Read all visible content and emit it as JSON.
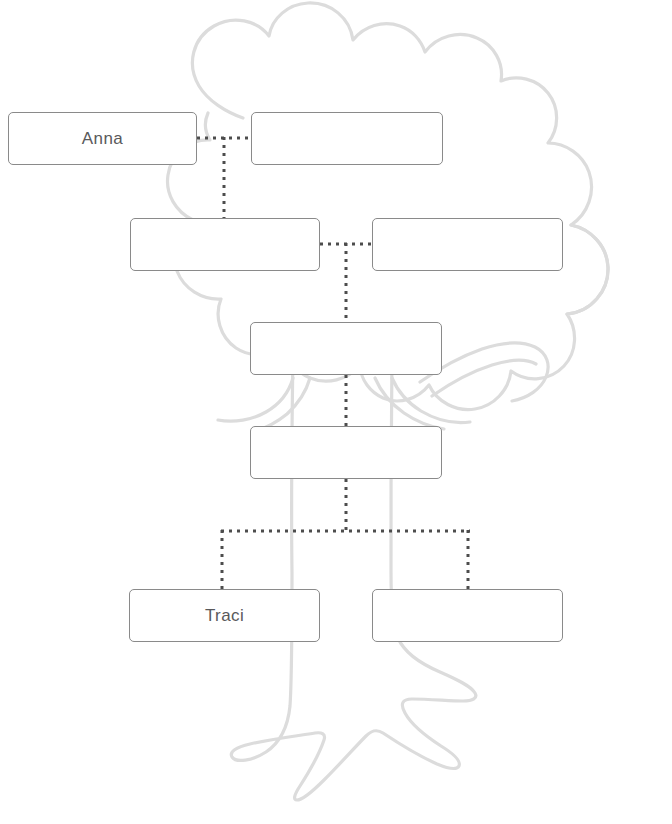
{
  "worksheet": {
    "title": "Family Tree Chart",
    "background_art": "family-tree-illustration",
    "colors": {
      "box_border": "#8a8a8a",
      "box_fill": "#ffffff",
      "text": "#59595b",
      "connector": "#4d4d4d",
      "tree_outline": "#dcdcdc",
      "page_background": "#ffffff"
    }
  },
  "boxes": [
    {
      "id": "gen1-left",
      "name": "Anna",
      "x": 8,
      "y": 112,
      "w": 189,
      "h": 53,
      "generation": 1,
      "filled": true
    },
    {
      "id": "gen1-right",
      "name": "",
      "x": 251,
      "y": 112,
      "w": 192,
      "h": 53,
      "generation": 1,
      "filled": false
    },
    {
      "id": "gen2-left",
      "name": "",
      "x": 130,
      "y": 218,
      "w": 190,
      "h": 53,
      "generation": 2,
      "filled": false
    },
    {
      "id": "gen2-right",
      "name": "",
      "x": 372,
      "y": 218,
      "w": 191,
      "h": 53,
      "generation": 2,
      "filled": false
    },
    {
      "id": "gen3-center",
      "name": "",
      "x": 250,
      "y": 322,
      "w": 192,
      "h": 53,
      "generation": 3,
      "filled": false
    },
    {
      "id": "gen4-center",
      "name": "",
      "x": 250,
      "y": 426,
      "w": 192,
      "h": 53,
      "generation": 4,
      "filled": false
    },
    {
      "id": "gen5-left",
      "name": "Traci",
      "x": 129,
      "y": 589,
      "w": 191,
      "h": 53,
      "generation": 5,
      "filled": true
    },
    {
      "id": "gen5-right",
      "name": "",
      "x": 372,
      "y": 589,
      "w": 191,
      "h": 53,
      "generation": 5,
      "filled": false
    }
  ],
  "connectors": {
    "style": "dotted",
    "dot_size": 3,
    "dot_pitch": 8,
    "color": "#4d4d4d",
    "segments": [
      {
        "id": "gen1-spouse-link",
        "type": "horizontal",
        "x1": 197,
        "x2": 251,
        "y": 138
      },
      {
        "id": "gen1-to-gen2-drop",
        "type": "vertical",
        "x": 224,
        "y1": 138,
        "y2": 218
      },
      {
        "id": "gen2-spouse-link",
        "type": "horizontal",
        "x1": 320,
        "x2": 372,
        "y": 244
      },
      {
        "id": "gen2-to-gen3-drop",
        "type": "vertical",
        "x": 346,
        "y1": 244,
        "y2": 322
      },
      {
        "id": "gen3-to-gen4-drop",
        "type": "vertical",
        "x": 346,
        "y1": 375,
        "y2": 426
      },
      {
        "id": "gen4-to-bus-drop",
        "type": "vertical",
        "x": 346,
        "y1": 479,
        "y2": 531
      },
      {
        "id": "children-bus",
        "type": "horizontal",
        "x1": 222,
        "x2": 468,
        "y": 531
      },
      {
        "id": "bus-to-gen5-left",
        "type": "vertical",
        "x": 222,
        "y1": 531,
        "y2": 589
      },
      {
        "id": "bus-to-gen5-right",
        "type": "vertical",
        "x": 468,
        "y1": 531,
        "y2": 589
      }
    ]
  }
}
